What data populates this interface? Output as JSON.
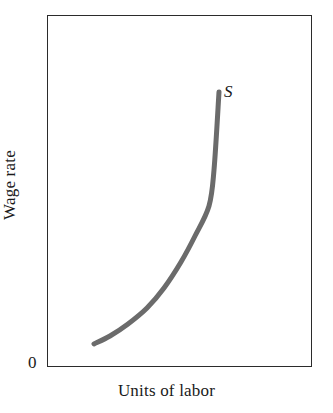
{
  "figure": {
    "width": 333,
    "height": 413,
    "background_color": "#ffffff",
    "frame_color": "#2b2b2b"
  },
  "chart_data": {
    "type": "line",
    "title": "",
    "subtitle": "",
    "xlabel": "Units of labor",
    "ylabel": "Wage rate",
    "origin_label": "0",
    "grid": false,
    "legend": false,
    "axis_ticks": false,
    "xlim": [
      0,
      100
    ],
    "ylim": [
      0,
      100
    ],
    "annotations": [
      {
        "text": "S",
        "style": "italic",
        "x": 68,
        "y": 80,
        "description": "label for the labor supply curve"
      }
    ],
    "series": [
      {
        "name": "S",
        "label": "S",
        "color": "#6b6b6b",
        "line_width": 5,
        "description": "upward-sloping convex labor supply curve",
        "x": [
          18,
          24,
          31,
          38,
          45,
          52,
          58,
          63,
          65
        ],
        "y": [
          6,
          10,
          16,
          24,
          34,
          47,
          60,
          72,
          78
        ],
        "points_px": [
          [
            94,
            344
          ],
          [
            110,
            336
          ],
          [
            128,
            324
          ],
          [
            147,
            308
          ],
          [
            164,
            288
          ],
          [
            181,
            262
          ],
          [
            195,
            236
          ],
          [
            209,
            206
          ],
          [
            214,
            170
          ],
          [
            219,
            92
          ]
        ]
      }
    ]
  }
}
